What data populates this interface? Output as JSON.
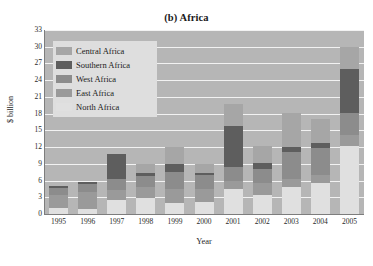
{
  "chart_data": {
    "type": "bar",
    "stacked": true,
    "title": "(b) Africa",
    "xlabel": "Year",
    "ylabel": "$ billion",
    "categories": [
      "1995",
      "1996",
      "1997",
      "1998",
      "1999",
      "2000",
      "2001",
      "2002",
      "2003",
      "2004",
      "2005"
    ],
    "ylim": [
      0,
      33
    ],
    "yticks": [
      0,
      3,
      6,
      9,
      12,
      15,
      18,
      21,
      24,
      27,
      30,
      33
    ],
    "grid": true,
    "legend_position": "top-left",
    "stack_order_bottom_to_top": [
      "North Africa",
      "East Africa",
      "West Africa",
      "Southern Africa",
      "Central Africa"
    ],
    "series": [
      {
        "name": "North Africa",
        "color": "#e0e0e0",
        "values": [
          1.0,
          0.9,
          2.5,
          2.8,
          2.0,
          2.1,
          4.5,
          3.5,
          4.8,
          5.6,
          12.2
        ]
      },
      {
        "name": "East Africa",
        "color": "#9a9a9a",
        "values": [
          2.5,
          3.0,
          1.8,
          2.0,
          2.5,
          2.3,
          1.4,
          2.0,
          1.5,
          1.4,
          2.0
        ]
      },
      {
        "name": "West Africa",
        "color": "#8c8c8c",
        "values": [
          1.2,
          1.4,
          2.0,
          2.0,
          3.0,
          2.6,
          2.6,
          2.5,
          4.9,
          4.8,
          4.0
        ]
      },
      {
        "name": "Southern Africa",
        "color": "#5e5e5e",
        "values": [
          0.4,
          0.5,
          4.4,
          0.6,
          1.4,
          0.4,
          7.3,
          1.2,
          0.9,
          0.9,
          7.8
        ]
      },
      {
        "name": "Central Africa",
        "color": "#a6a6a6",
        "values": [
          0.0,
          0.0,
          0.0,
          1.5,
          3.2,
          1.5,
          3.9,
          3.0,
          6.0,
          4.4,
          4.0
        ]
      }
    ],
    "totals": [
      5.1,
      5.8,
      10.7,
      8.9,
      12.1,
      8.9,
      19.7,
      12.2,
      18.1,
      17.1,
      30.0
    ]
  },
  "legend": {
    "items": [
      {
        "label": "Central Africa",
        "color": "#a6a6a6"
      },
      {
        "label": "Southern Africa",
        "color": "#5e5e5e"
      },
      {
        "label": "West Africa",
        "color": "#8c8c8c"
      },
      {
        "label": "East Africa",
        "color": "#9a9a9a"
      },
      {
        "label": "North Africa",
        "color": "#e0e0e0"
      }
    ]
  }
}
